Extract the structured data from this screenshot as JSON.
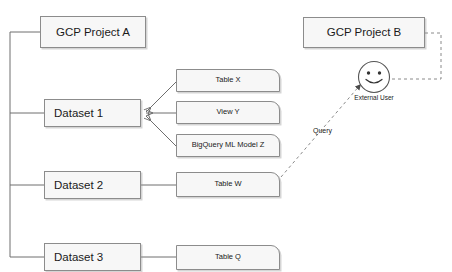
{
  "diagram": {
    "colors": {
      "node_fill": "#f7f7f7",
      "node_border": "#8c8c8c",
      "line": "#6e6e6e",
      "text": "#1a1a1a",
      "background": "#ffffff"
    },
    "projects": [
      {
        "id": "project-a",
        "label": "GCP Project A"
      },
      {
        "id": "project-b",
        "label": "GCP Project B"
      }
    ],
    "datasets": [
      {
        "id": "dataset-1",
        "label": "Dataset 1"
      },
      {
        "id": "dataset-2",
        "label": "Dataset 2"
      },
      {
        "id": "dataset-3",
        "label": "Dataset 3"
      }
    ],
    "assets": [
      {
        "id": "table-x",
        "label": "Table X"
      },
      {
        "id": "view-y",
        "label": "View Y"
      },
      {
        "id": "model-z",
        "label": "BigQuery ML Model Z"
      },
      {
        "id": "table-w",
        "label": "Table W"
      },
      {
        "id": "table-q",
        "label": "Table Q"
      }
    ],
    "actor": {
      "id": "external-user",
      "label": "External User",
      "icon": "smiley-face-icon"
    },
    "edge_labels": [
      {
        "id": "query-edge",
        "label": "Query"
      }
    ]
  }
}
